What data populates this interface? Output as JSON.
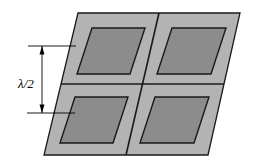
{
  "figure": {
    "type": "technical-diagram",
    "canvas": {
      "width": 254,
      "height": 164,
      "background": "#ffffff"
    },
    "colors": {
      "ground_fill": "#b3b3b3",
      "patch_fill": "#8c8c8c",
      "outline": "#1a1a1a",
      "annotation": "#000000",
      "background": "#ffffff"
    },
    "annotation": {
      "label": "λ/2",
      "label_x": 18,
      "label_y": 88,
      "description": "half-wavelength element spacing",
      "arrow": {
        "x": 42,
        "y_top": 46,
        "y_bottom": 113,
        "head_size": 4
      },
      "leader_top": {
        "x1": 28,
        "y1": 46,
        "x2": 76,
        "y2": 46
      },
      "leader_bottom": {
        "x1": 27,
        "y1": 113,
        "x2": 75,
        "y2": 113
      }
    },
    "ground_plane": {
      "name": "ground-plane",
      "points": "78,13 240,13 208,155 44,155"
    },
    "dividers": [
      {
        "name": "divider-horizontal",
        "x1": 61,
        "y1": 84,
        "x2": 224,
        "y2": 84
      },
      {
        "name": "divider-vertical",
        "x1": 159,
        "y1": 13,
        "x2": 126,
        "y2": 155
      }
    ],
    "patches": [
      {
        "name": "patch-top-left",
        "position": "top-left",
        "points": "92,28 145,28 130,74 77,74"
      },
      {
        "name": "patch-top-right",
        "points": "172,28 226,28 211,74 157,74",
        "position": "top-right"
      },
      {
        "name": "patch-bottom-left",
        "points": "75,97 128,97 113,143 60,143",
        "position": "bottom-left"
      },
      {
        "name": "patch-bottom-right",
        "points": "155,97 209,97 194,143 140,143",
        "position": "bottom-right"
      }
    ]
  }
}
